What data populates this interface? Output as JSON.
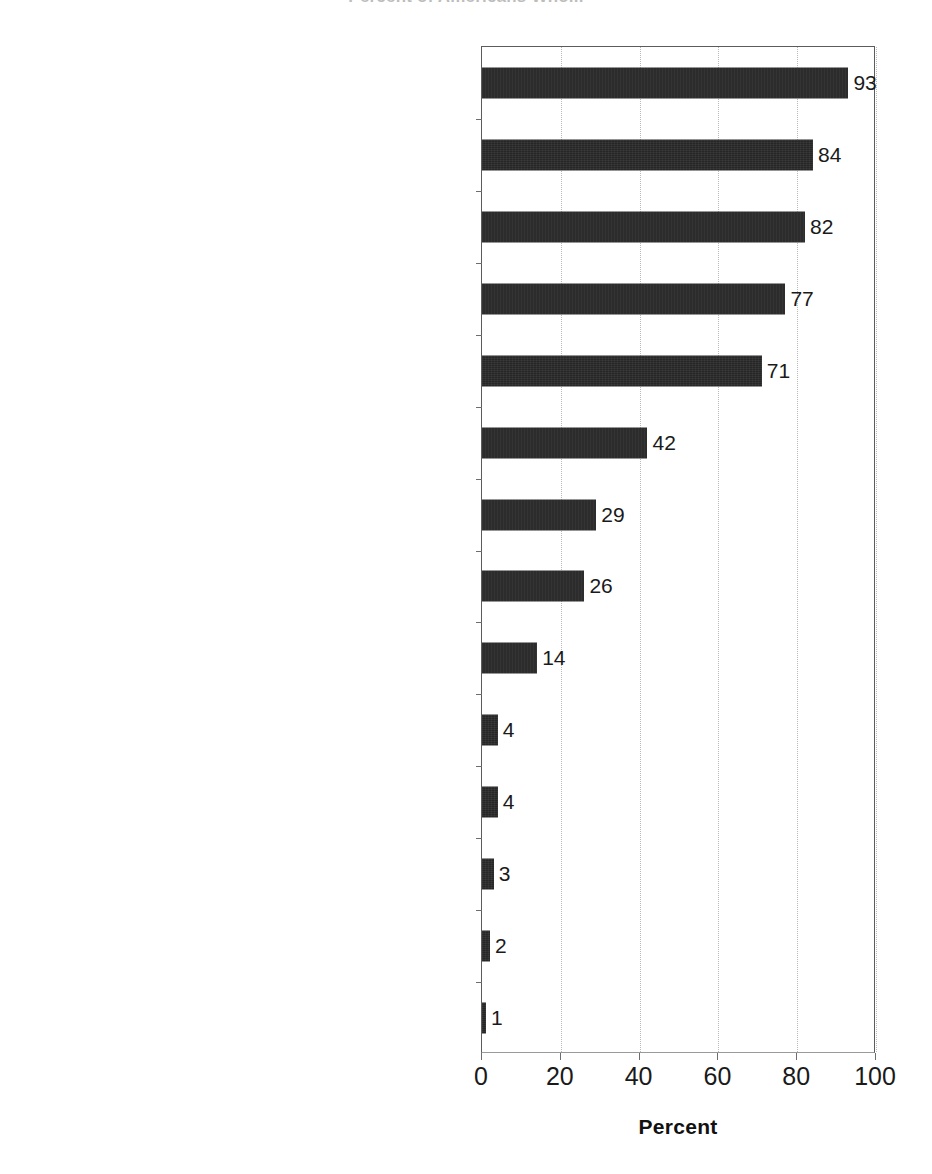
{
  "chart_data": {
    "type": "bar",
    "orientation": "horizontal",
    "title": "Percent of Americans Who...",
    "xlabel": "Percent",
    "ylabel": "",
    "xlim": [
      0,
      100
    ],
    "xticks": [
      0,
      20,
      40,
      60,
      80,
      100
    ],
    "xticklabels": [
      "0",
      "20",
      "40",
      "60",
      "80",
      "100"
    ],
    "grid": "vertical-dotted",
    "legend": null,
    "bar_color": "#262626",
    "categories": [
      "Eat meat",
      "Approve of hunting for the meat",
      "Think animals can be used by humans, as long as the animal does not experience undue pain and suffering",
      "Think it is acceptable to use animals in research, as long as it does not harm or kill any animals",
      "Wear leather shoes, gloves, or other clothing",
      "Think it is acceptable to use animals in research, EVEN IF it may harm or kill some animals",
      "Appprove of hunting for a trophy",
      "Do not wear leather",
      "Think animals have rights like humans and should not be used in any way",
      "Do not eat meat or poultry",
      "Think animals can be used by humans regardless of the animal's welfare or rights",
      "Think all animal use should be banned",
      "Do not eat meat OR wear leather",
      "Self-identify as animal rights proponents AND do not eat meat or wear leather"
    ],
    "values": [
      93,
      84,
      82,
      77,
      71,
      42,
      29,
      26,
      14,
      4,
      4,
      3,
      2,
      1
    ],
    "value_labels": [
      "93",
      "84",
      "82",
      "77",
      "71",
      "42",
      "29",
      "26",
      "14",
      "4",
      "4",
      "3",
      "2",
      "1"
    ]
  }
}
